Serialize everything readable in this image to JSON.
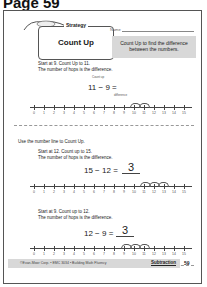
{
  "header": {
    "title": "Page 59"
  },
  "worksheet": {
    "strategy_label": "Strategy",
    "strategy_title": "Count Up",
    "name_label": "Name",
    "tip": "Count Up to find the difference between the numbers.",
    "example": {
      "instruction_1": "Start at 9. Count Up to 11.",
      "instruction_2": "The number of hops is the difference.",
      "equation": "11 − 9 =",
      "annotation_top": "Count up",
      "annotation_bottom": "difference",
      "number_line": [
        "0",
        "1",
        "2",
        "3",
        "4",
        "5",
        "6",
        "7",
        "8",
        "9",
        "10",
        "11",
        "12",
        "13",
        "14",
        "15"
      ],
      "start": 9,
      "end": 11
    },
    "use_prompt": "Use the number line to Count Up.",
    "problems": [
      {
        "instruction_1": "Start at 12. Count up to 15.",
        "instruction_2": "The number of hops is the difference.",
        "equation": "15 − 12 =",
        "answer": "3",
        "hop_labels": [
          "1",
          "2",
          "3"
        ],
        "start": 12,
        "end": 15
      },
      {
        "instruction_1": "Start at 9. Count up to 12.",
        "instruction_2": "The number of hops is the difference.",
        "equation": "12 − 9 =",
        "answer": "3",
        "hop_labels": [
          "1",
          "2",
          "3"
        ],
        "start": 9,
        "end": 12
      }
    ],
    "footer": {
      "copyright": "©Evan-Moor Corp. • EMC 3034 • Building Math Fluency",
      "subject": "Subtraction",
      "page_number": "59"
    }
  }
}
